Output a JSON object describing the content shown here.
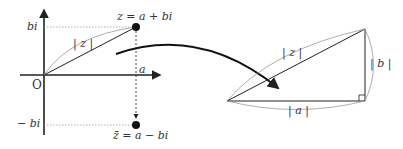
{
  "left_diagram": {
    "y_tick_top": "bi",
    "y_tick_bottom": "− bi",
    "x_tick": "a",
    "origin": "O",
    "modulus": "| z |",
    "point_z": "z = a + bi",
    "point_conj": "z̄ = a − bi"
  },
  "right_diagram": {
    "hypotenuse": "| z |",
    "vertical": "| b |",
    "base": "| a |"
  },
  "colors": {
    "stroke": "#222222",
    "guide": "#888888",
    "brace": "#999999"
  }
}
